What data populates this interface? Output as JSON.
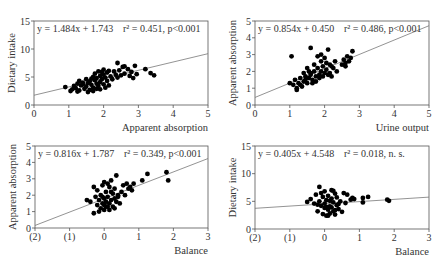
{
  "chart_data": [
    {
      "id": "p1",
      "type": "scatter",
      "title": "",
      "equation": "y = 1.484x + 1.743",
      "stats": "r² = 0.451, p<0.001",
      "xlabel": "Apparent absorption",
      "ylabel": "Dietary intake",
      "xlim": [
        0,
        5
      ],
      "ylim": [
        0,
        15
      ],
      "xticks": [
        0,
        1,
        2,
        3,
        4,
        5
      ],
      "xtick_labels": [
        "0",
        "1",
        "2",
        "3",
        "4",
        "5"
      ],
      "yticks": [
        0,
        5,
        10,
        15
      ],
      "ytick_labels": [
        "0",
        "5",
        "10",
        "15"
      ],
      "frame": {
        "x0": 34,
        "y0": 21,
        "x1": 208,
        "y1": 105
      },
      "fit": {
        "slope": 1.484,
        "intercept": 1.743
      },
      "points": [
        [
          0.9,
          3.2
        ],
        [
          1.05,
          2.5
        ],
        [
          1.1,
          2.8
        ],
        [
          1.15,
          3.4
        ],
        [
          1.2,
          3.0
        ],
        [
          1.25,
          3.8
        ],
        [
          1.3,
          4.3
        ],
        [
          1.3,
          2.6
        ],
        [
          1.35,
          3.5
        ],
        [
          1.4,
          4.0
        ],
        [
          1.45,
          2.9
        ],
        [
          1.5,
          3.3
        ],
        [
          1.5,
          4.6
        ],
        [
          1.55,
          3.9
        ],
        [
          1.6,
          2.7
        ],
        [
          1.6,
          4.2
        ],
        [
          1.65,
          3.6
        ],
        [
          1.7,
          5.0
        ],
        [
          1.7,
          3.1
        ],
        [
          1.75,
          4.4
        ],
        [
          1.75,
          5.6
        ],
        [
          1.8,
          3.8
        ],
        [
          1.8,
          4.8
        ],
        [
          1.85,
          6.0
        ],
        [
          1.85,
          3.4
        ],
        [
          1.9,
          4.1
        ],
        [
          1.9,
          5.2
        ],
        [
          1.95,
          4.6
        ],
        [
          2.0,
          3.7
        ],
        [
          2.0,
          6.3
        ],
        [
          2.0,
          5.4
        ],
        [
          2.05,
          4.9
        ],
        [
          2.1,
          4.3
        ],
        [
          2.1,
          5.8
        ],
        [
          2.15,
          3.5
        ],
        [
          2.2,
          5.1
        ],
        [
          2.25,
          4.6
        ],
        [
          2.3,
          6.0
        ],
        [
          2.35,
          5.4
        ],
        [
          2.4,
          7.5
        ],
        [
          2.4,
          4.9
        ],
        [
          2.45,
          6.2
        ],
        [
          2.5,
          5.3
        ],
        [
          2.55,
          6.8
        ],
        [
          2.6,
          5.6
        ],
        [
          2.7,
          6.4
        ],
        [
          2.75,
          5.2
        ],
        [
          2.8,
          5.9
        ],
        [
          2.85,
          4.8
        ],
        [
          2.9,
          7.0
        ],
        [
          2.95,
          5.5
        ],
        [
          3.2,
          6.4
        ],
        [
          3.35,
          5.7
        ],
        [
          3.45,
          5.3
        ],
        [
          1.55,
          2.3
        ],
        [
          1.7,
          2.5
        ],
        [
          1.9,
          2.8
        ],
        [
          2.05,
          3.1
        ],
        [
          1.4,
          3.7
        ],
        [
          1.65,
          4.7
        ],
        [
          1.95,
          5.9
        ],
        [
          2.15,
          6.1
        ],
        [
          2.6,
          6.9
        ],
        [
          1.25,
          2.4
        ],
        [
          1.8,
          2.9
        ]
      ]
    },
    {
      "id": "p2",
      "type": "scatter",
      "title": "",
      "equation": "y = 0.854x + 0.450",
      "stats": "r² = 0.486, p<0.001",
      "xlabel": "Urine output",
      "ylabel": "Apparent absorption",
      "xlim": [
        0,
        5
      ],
      "ylim": [
        0,
        5
      ],
      "xticks": [
        0,
        1,
        2,
        3,
        4,
        5
      ],
      "xtick_labels": [
        "0",
        "1",
        "2",
        "3",
        "4",
        "5"
      ],
      "yticks": [
        0,
        1,
        2,
        3,
        4,
        5
      ],
      "ytick_labels": [
        "0",
        "1",
        "2",
        "3",
        "4",
        "5"
      ],
      "frame": {
        "x0": 255,
        "y0": 21,
        "x1": 429,
        "y1": 105
      },
      "fit": {
        "slope": 0.854,
        "intercept": 0.45
      },
      "points": [
        [
          1.0,
          1.3
        ],
        [
          1.05,
          2.9
        ],
        [
          1.1,
          1.2
        ],
        [
          1.15,
          1.5
        ],
        [
          1.2,
          1.0
        ],
        [
          1.2,
          0.9
        ],
        [
          1.25,
          1.3
        ],
        [
          1.3,
          1.6
        ],
        [
          1.35,
          1.1
        ],
        [
          1.4,
          1.4
        ],
        [
          1.45,
          1.7
        ],
        [
          1.5,
          1.3
        ],
        [
          1.5,
          2.2
        ],
        [
          1.55,
          1.6
        ],
        [
          1.6,
          1.9
        ],
        [
          1.6,
          3.4
        ],
        [
          1.65,
          1.5
        ],
        [
          1.7,
          2.0
        ],
        [
          1.7,
          2.4
        ],
        [
          1.75,
          1.7
        ],
        [
          1.8,
          2.2
        ],
        [
          1.8,
          2.9
        ],
        [
          1.85,
          1.8
        ],
        [
          1.9,
          2.6
        ],
        [
          1.9,
          2.0
        ],
        [
          1.95,
          2.3
        ],
        [
          2.0,
          1.9
        ],
        [
          2.0,
          2.8
        ],
        [
          2.05,
          2.1
        ],
        [
          2.1,
          3.3
        ],
        [
          2.1,
          1.8
        ],
        [
          2.15,
          2.4
        ],
        [
          2.2,
          1.7
        ],
        [
          2.25,
          2.2
        ],
        [
          2.3,
          2.6
        ],
        [
          2.35,
          2.0
        ],
        [
          2.5,
          2.4
        ],
        [
          2.55,
          2.7
        ],
        [
          2.6,
          2.5
        ],
        [
          2.65,
          2.9
        ],
        [
          2.7,
          2.6
        ],
        [
          2.75,
          2.8
        ],
        [
          2.8,
          3.2
        ],
        [
          1.4,
          1.9
        ],
        [
          1.55,
          2.0
        ],
        [
          1.65,
          1.3
        ],
        [
          1.75,
          1.4
        ],
        [
          1.85,
          1.6
        ],
        [
          1.95,
          1.7
        ],
        [
          2.05,
          2.5
        ],
        [
          2.15,
          1.9
        ],
        [
          1.3,
          1.2
        ],
        [
          1.45,
          1.5
        ],
        [
          1.6,
          1.8
        ],
        [
          2.2,
          2.3
        ],
        [
          1.9,
          3.0
        ],
        [
          2.6,
          2.3
        ]
      ]
    },
    {
      "id": "p3",
      "type": "scatter",
      "title": "",
      "equation": "y = 0.816x + 1.787",
      "stats": "r² = 0.349, p<0.001",
      "xlabel": "Balance",
      "ylabel": "Apparent absorption",
      "xlim": [
        -2,
        3
      ],
      "ylim": [
        0,
        5
      ],
      "xticks": [
        -2,
        -1,
        0,
        1,
        2,
        3
      ],
      "xtick_labels": [
        "(2)",
        "(1)",
        "0",
        "1",
        "2",
        "3"
      ],
      "yticks": [
        0,
        1,
        2,
        3,
        4,
        5
      ],
      "ytick_labels": [
        "0",
        "1",
        "2",
        "3",
        "4",
        "5"
      ],
      "frame": {
        "x0": 35,
        "y0": 146,
        "x1": 208,
        "y1": 228
      },
      "fit": {
        "slope": 0.816,
        "intercept": 1.787
      },
      "points": [
        [
          -0.5,
          1.7
        ],
        [
          -0.4,
          1.6
        ],
        [
          -0.3,
          2.5
        ],
        [
          -0.3,
          0.9
        ],
        [
          -0.25,
          1.9
        ],
        [
          -0.2,
          1.4
        ],
        [
          -0.2,
          2.3
        ],
        [
          -0.15,
          1.7
        ],
        [
          -0.1,
          1.2
        ],
        [
          -0.1,
          2.0
        ],
        [
          -0.05,
          1.5
        ],
        [
          0.0,
          2.8
        ],
        [
          0.0,
          1.8
        ],
        [
          0.0,
          1.1
        ],
        [
          0.05,
          1.6
        ],
        [
          0.05,
          2.2
        ],
        [
          0.1,
          1.3
        ],
        [
          0.1,
          1.9
        ],
        [
          0.15,
          2.5
        ],
        [
          0.15,
          1.5
        ],
        [
          0.2,
          1.7
        ],
        [
          0.2,
          2.9
        ],
        [
          0.25,
          2.1
        ],
        [
          0.25,
          1.3
        ],
        [
          0.3,
          1.8
        ],
        [
          0.3,
          2.4
        ],
        [
          0.35,
          1.6
        ],
        [
          0.35,
          3.2
        ],
        [
          0.4,
          2.0
        ],
        [
          0.45,
          1.5
        ],
        [
          0.5,
          2.2
        ],
        [
          0.55,
          2.6
        ],
        [
          0.6,
          2.0
        ],
        [
          0.65,
          2.7
        ],
        [
          0.7,
          2.4
        ],
        [
          0.75,
          2.5
        ],
        [
          0.8,
          2.3
        ],
        [
          0.85,
          2.7
        ],
        [
          1.1,
          2.9
        ],
        [
          1.25,
          3.3
        ],
        [
          1.8,
          3.4
        ],
        [
          1.85,
          2.9
        ],
        [
          -0.05,
          2.6
        ],
        [
          0.1,
          2.7
        ],
        [
          0.0,
          1.4
        ],
        [
          0.15,
          1.1
        ],
        [
          -0.15,
          1.0
        ],
        [
          0.3,
          1.2
        ],
        [
          0.4,
          1.9
        ],
        [
          0.2,
          2.2
        ],
        [
          -0.05,
          1.9
        ],
        [
          0.05,
          1.3
        ]
      ]
    },
    {
      "id": "p4",
      "type": "scatter",
      "title": "",
      "equation": "y = 0.405x + 4.548",
      "stats": "r² = 0.018, n. s.",
      "xlabel": "Balance",
      "ylabel": "Dietary intake",
      "xlim": [
        -2,
        3
      ],
      "ylim": [
        0,
        15
      ],
      "xticks": [
        -2,
        -1,
        0,
        1,
        2,
        3
      ],
      "xtick_labels": [
        "(2)",
        "(1)",
        "0",
        "1",
        "2",
        "3"
      ],
      "yticks": [
        0,
        5,
        10,
        15
      ],
      "ytick_labels": [
        "0",
        "5",
        "10",
        "15"
      ],
      "frame": {
        "x0": 255,
        "y0": 146,
        "x1": 429,
        "y1": 229
      },
      "fit": {
        "slope": 0.405,
        "intercept": 4.548
      },
      "points": [
        [
          -0.5,
          4.9
        ],
        [
          -0.4,
          5.4
        ],
        [
          -0.3,
          4.6
        ],
        [
          -0.25,
          6.2
        ],
        [
          -0.2,
          3.2
        ],
        [
          -0.15,
          7.6
        ],
        [
          -0.15,
          5.0
        ],
        [
          -0.1,
          4.2
        ],
        [
          -0.05,
          2.7
        ],
        [
          -0.05,
          5.8
        ],
        [
          0.0,
          3.8
        ],
        [
          0.0,
          6.8
        ],
        [
          0.0,
          4.6
        ],
        [
          0.05,
          2.4
        ],
        [
          0.05,
          5.2
        ],
        [
          0.1,
          3.5
        ],
        [
          0.1,
          6.0
        ],
        [
          0.15,
          4.1
        ],
        [
          0.15,
          2.8
        ],
        [
          0.2,
          5.5
        ],
        [
          0.2,
          7.0
        ],
        [
          0.25,
          3.2
        ],
        [
          0.25,
          4.8
        ],
        [
          0.3,
          6.4
        ],
        [
          0.3,
          2.6
        ],
        [
          0.35,
          4.3
        ],
        [
          0.35,
          5.7
        ],
        [
          0.4,
          3.6
        ],
        [
          0.45,
          5.0
        ],
        [
          0.5,
          3.1
        ],
        [
          0.55,
          6.5
        ],
        [
          0.6,
          4.7
        ],
        [
          0.65,
          6.2
        ],
        [
          0.75,
          5.3
        ],
        [
          0.8,
          5.6
        ],
        [
          0.85,
          5.4
        ],
        [
          1.1,
          5.6
        ],
        [
          1.1,
          4.8
        ],
        [
          1.25,
          5.8
        ],
        [
          1.8,
          5.3
        ],
        [
          1.85,
          5.1
        ],
        [
          -0.1,
          6.5
        ],
        [
          0.05,
          4.0
        ],
        [
          0.2,
          3.9
        ],
        [
          0.15,
          5.1
        ],
        [
          -0.2,
          4.4
        ],
        [
          0.4,
          4.5
        ],
        [
          0.3,
          3.4
        ],
        [
          0.1,
          2.4
        ],
        [
          0.25,
          6.9
        ]
      ]
    }
  ]
}
